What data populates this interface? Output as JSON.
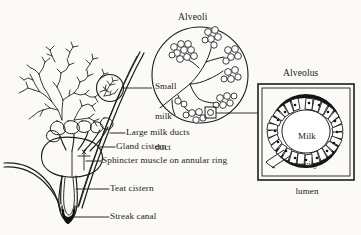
{
  "figure": {
    "background_color": "#fbfaf7",
    "ink_color": "#1a1a1a"
  },
  "titles": {
    "alveoli": "Alveoli",
    "alveolus": "Alveolus"
  },
  "callouts": [
    {
      "id": "large-milk-ducts",
      "label": "Large milk ducts"
    },
    {
      "id": "gland-cistern",
      "label": "Gland cistern"
    },
    {
      "id": "sphincter-muscle",
      "label": "Sphincter muscle on annular ring"
    },
    {
      "id": "teat-cistern",
      "label": "Teat cistern"
    },
    {
      "id": "streak-canal",
      "label": "Streak canal"
    }
  ],
  "inset_labels": {
    "small_milk_duct": [
      "Small",
      "milk",
      "duct"
    ],
    "milk_cavity_lumen": [
      "Milk",
      "cavity",
      "lumen"
    ]
  },
  "icons": {
    "magnifier_circle": "magnifier-circle-icon",
    "magnifier_square": "magnifier-square-icon",
    "leader_line": "leader-line-icon"
  }
}
